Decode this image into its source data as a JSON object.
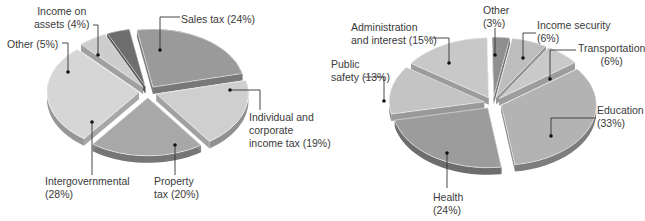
{
  "chart_data": [
    {
      "type": "pie",
      "title": "",
      "style": "exploded 3D pie",
      "slices": [
        {
          "label": "Sales tax",
          "value": 24,
          "display": "Sales tax (24%)",
          "color": "#9a9a9a"
        },
        {
          "label": "Individual and corporate income tax",
          "value": 19,
          "display": "Individual and corporate income tax (19%)",
          "color": "#cfcfcf"
        },
        {
          "label": "Property tax",
          "value": 20,
          "display": "Property tax (20%)",
          "color": "#a8a8a8"
        },
        {
          "label": "Intergovernmental",
          "value": 28,
          "display": "Intergovernmental (28%)",
          "color": "#d6d6d6"
        },
        {
          "label": "Other",
          "value": 5,
          "display": "Other (5%)",
          "color": "#cdcdcd"
        },
        {
          "label": "Income on assets",
          "value": 4,
          "display": "Income on assets (4%)",
          "color": "#6e6e6e"
        }
      ],
      "labels": {
        "sales": "Sales tax (24%)",
        "individual_1": "Individual and",
        "individual_2": "corporate",
        "individual_3": "income tax (19%)",
        "property_1": "Property",
        "property_2": "tax (20%)",
        "intergov_1": "Intergovernmental",
        "intergov_2": "(28%)",
        "other": "Other (5%)",
        "assets_1": "Income on",
        "assets_2": "assets (4%)"
      }
    },
    {
      "type": "pie",
      "title": "",
      "style": "exploded 3D pie",
      "slices": [
        {
          "label": "Other",
          "value": 3,
          "display": "Other (3%)",
          "color": "#8f8f8f"
        },
        {
          "label": "Income security",
          "value": 6,
          "display": "Income security (6%)",
          "color": "#bdbdbd"
        },
        {
          "label": "Transportation",
          "value": 6,
          "display": "Transportation (6%)",
          "color": "#c9c9c9"
        },
        {
          "label": "Education",
          "value": 33,
          "display": "Education (33%)",
          "color": "#b3b3b3"
        },
        {
          "label": "Health",
          "value": 24,
          "display": "Health (24%)",
          "color": "#9c9c9c"
        },
        {
          "label": "Public safety",
          "value": 13,
          "display": "Public safety (13%)",
          "color": "#c4c4c4"
        },
        {
          "label": "Administration and interest",
          "value": 15,
          "display": "Administration and interest (15%)",
          "color": "#c8c8c8"
        }
      ],
      "labels": {
        "other_1": "Other",
        "other_2": "(3%)",
        "income_1": "Income security",
        "income_2": "(6%)",
        "transport_1": "Transportation",
        "transport_2": "(6%)",
        "education_1": "Education",
        "education_2": "(33%)",
        "health_1": "Health",
        "health_2": "(24%)",
        "safety_1": "Public",
        "safety_2": "safety (13%)",
        "admin_1": "Administration",
        "admin_2": "and interest (15%)"
      }
    }
  ]
}
